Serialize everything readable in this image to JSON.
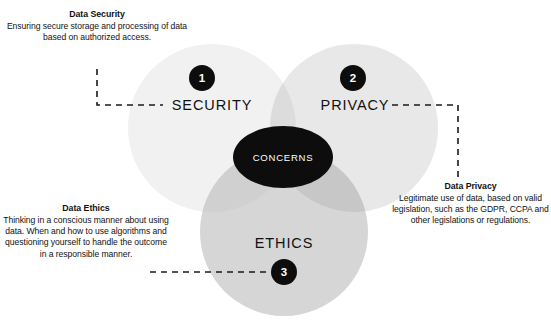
{
  "diagram": {
    "type": "venn-3-circle",
    "core": {
      "label": "CONCERNS",
      "color": "#0d0d0d",
      "text_color": "#ffffff"
    },
    "circles": [
      {
        "id": "security",
        "label": "SECURITY",
        "number": "1",
        "color": "#f1f1f1",
        "cx": 212,
        "cy": 128,
        "r": 84
      },
      {
        "id": "privacy",
        "label": "PRIVACY",
        "number": "2",
        "color": "#e8e8e8",
        "cx": 354,
        "cy": 128,
        "r": 84
      },
      {
        "id": "ethics",
        "label": "ETHICS",
        "number": "3",
        "color": "#d6d6d6",
        "cx": 284,
        "cy": 232,
        "r": 84
      }
    ],
    "annotations": [
      {
        "id": "data-security",
        "title": "Data Security",
        "body": "Ensuring secure storage and processing of data based on authorized access."
      },
      {
        "id": "data-privacy",
        "title": "Data Privacy",
        "body": "Legitimate use of data, based on valid legislation, such as the GDPR, CCPA and other legislations or regulations."
      },
      {
        "id": "data-ethics",
        "title": "Data Ethics",
        "body": "Thinking in a conscious manner about using data. When and how to use algorithms and questioning yourself to handle the outcome in a responsible manner."
      }
    ],
    "connectors": {
      "line_color": "#1a1a1a",
      "style": "dashed"
    }
  }
}
